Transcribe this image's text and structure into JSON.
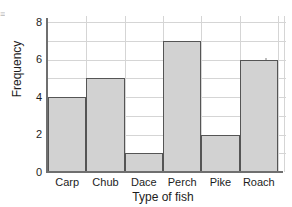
{
  "chart_data": {
    "type": "bar",
    "title": "",
    "xlabel": "Type of fish",
    "ylabel": "Frequency",
    "categories": [
      "Carp",
      "Chub",
      "Dace",
      "Perch",
      "Pike",
      "Roach"
    ],
    "values": [
      4,
      5,
      1,
      7,
      2,
      6
    ],
    "ylim": [
      0,
      8
    ],
    "y_ticks": [
      0,
      2,
      4,
      6,
      8
    ],
    "y_tick_labels": [
      "0",
      "2",
      "4",
      "6",
      "8"
    ],
    "gridlines": [
      1,
      2,
      3,
      4,
      5,
      6,
      7,
      8
    ],
    "grid": true,
    "legend": "none",
    "bar_fill_color": "#d2d2d2",
    "bar_edge_color": "#555555",
    "grid_color": "#d5d5d5",
    "axis_color": "#6f6f6f",
    "text_color": "#1c1c1c"
  },
  "axes": {
    "y_title": "Frequency",
    "x_title": "Type of fish",
    "y_tick_0": "0",
    "y_tick_2": "2",
    "y_tick_4": "4",
    "y_tick_6": "6",
    "y_tick_8": "8"
  },
  "bars": [
    {
      "label": "Carp",
      "value": 4
    },
    {
      "label": "Chub",
      "value": 5
    },
    {
      "label": "Dace",
      "value": 1
    },
    {
      "label": "Perch",
      "value": 7
    },
    {
      "label": "Pike",
      "value": 2
    },
    {
      "label": "Roach",
      "value": 6
    }
  ],
  "artifact": {
    "edge_marks": "≡"
  }
}
